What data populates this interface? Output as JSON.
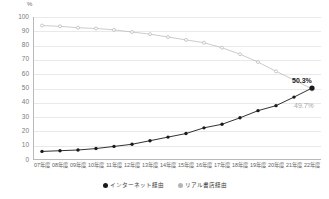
{
  "chart_data": {
    "type": "line",
    "title": "",
    "xlabel": "",
    "ylabel": "%",
    "unit_label": "%",
    "ylim": [
      0,
      100
    ],
    "ytick_values": [
      0,
      10,
      20,
      30,
      40,
      50,
      60,
      70,
      80,
      90,
      100
    ],
    "ytick_labels": [
      "0",
      "10",
      "20",
      "30",
      "40",
      "50",
      "60",
      "70",
      "80",
      "90",
      "100"
    ],
    "grid": true,
    "legend_position": "bottom-center",
    "categories": [
      "07年度",
      "08年度",
      "09年度",
      "10年度",
      "11年度",
      "12年度",
      "13年度",
      "14年度",
      "15年度",
      "16年度",
      "17年度",
      "18年度",
      "19年度",
      "20年度",
      "21年度",
      "22年度"
    ],
    "series": [
      {
        "name": "インターネット経由",
        "color": "#1a1a1a",
        "marker": "circle-filled",
        "values": [
          6.0,
          6.5,
          7.0,
          8.0,
          9.5,
          11.0,
          13.5,
          16.0,
          18.5,
          22.5,
          25.0,
          29.5,
          34.5,
          38.0,
          44.0,
          50.3
        ]
      },
      {
        "name": "リアル書店経由",
        "color": "#b4b4b4",
        "marker": "circle-open",
        "values": [
          94.0,
          93.5,
          92.5,
          92.0,
          91.0,
          89.5,
          88.0,
          86.0,
          84.0,
          82.0,
          78.5,
          74.0,
          68.5,
          62.0,
          56.0,
          49.7
        ]
      }
    ],
    "annotations": [
      {
        "text": "50.3%",
        "series": "インターネット経由",
        "category": "22年度",
        "emphasis": "bold"
      },
      {
        "text": "49.7%",
        "series": "リアル書店経由",
        "category": "22年度",
        "emphasis": "muted"
      }
    ]
  },
  "legend": {
    "items": [
      {
        "label": "インターネット経由",
        "swatch": "dark"
      },
      {
        "label": "リアル書店経由",
        "swatch": "light"
      }
    ]
  }
}
